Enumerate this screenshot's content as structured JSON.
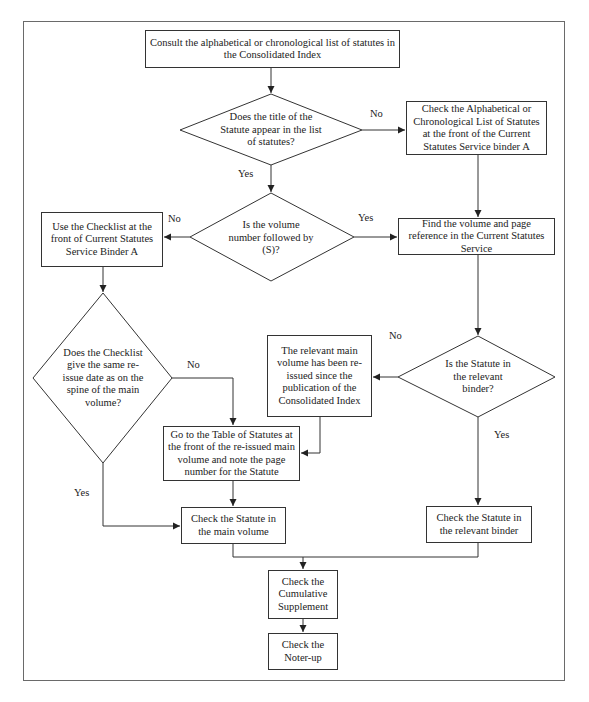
{
  "flowchart": {
    "nodes": {
      "start": "Consult the alphabetical or chronological list of statutes in the Consolidated Index",
      "q_title": "Does the title of the Statute appear in the list of statutes?",
      "check_alpha": "Check the Alphabetical or Chronological List of Statutes at the front of the Current Statutes Service binder A",
      "q_volume": "Is the volume number followed by (S)?",
      "use_checklist": "Use the Checklist at the front of Current Statutes Service Binder A",
      "find_volume": "Find the volume and page reference in the Current Statutes Service",
      "q_checklist": "Does the Checklist give the same re-issue date as on the spine of the main volume?",
      "reissued": "The relevant main volume has been re-issued since the publication of the Consolidated Index",
      "q_binder": "Is the Statute in the relevant binder?",
      "table_of_statutes": "Go to the Table of Statutes at the front of the re-issued main volume and note the page number for the Statute",
      "check_main": "Check the Statute in the main volume",
      "check_binder": "Check the Statute in the relevant binder",
      "cumulative": "Check the Cumulative Supplement",
      "noter_up": "Check the Noter-up"
    },
    "edge_labels": {
      "q_title_no": "No",
      "q_title_yes": "Yes",
      "q_volume_no": "No",
      "q_volume_yes": "Yes",
      "q_checklist_no": "No",
      "q_checklist_yes": "Yes",
      "q_binder_no": "No",
      "q_binder_yes": "Yes"
    },
    "edges": [
      {
        "from": "start",
        "to": "q_title"
      },
      {
        "from": "q_title",
        "to": "check_alpha",
        "label": "No"
      },
      {
        "from": "q_title",
        "to": "q_volume",
        "label": "Yes"
      },
      {
        "from": "check_alpha",
        "to": "find_volume"
      },
      {
        "from": "q_volume",
        "to": "use_checklist",
        "label": "No"
      },
      {
        "from": "q_volume",
        "to": "find_volume",
        "label": "Yes"
      },
      {
        "from": "use_checklist",
        "to": "q_checklist"
      },
      {
        "from": "find_volume",
        "to": "q_binder"
      },
      {
        "from": "q_checklist",
        "to": "table_of_statutes",
        "label": "No"
      },
      {
        "from": "q_checklist",
        "to": "check_main",
        "label": "Yes"
      },
      {
        "from": "q_binder",
        "to": "reissued",
        "label": "No"
      },
      {
        "from": "q_binder",
        "to": "check_binder",
        "label": "Yes"
      },
      {
        "from": "reissued",
        "to": "table_of_statutes"
      },
      {
        "from": "table_of_statutes",
        "to": "check_main"
      },
      {
        "from": "check_main",
        "to": "cumulative"
      },
      {
        "from": "check_binder",
        "to": "cumulative"
      },
      {
        "from": "cumulative",
        "to": "noter_up"
      }
    ],
    "colors": {
      "line": "#333333",
      "frame": "#6a6a6a",
      "background": "#ffffff"
    }
  }
}
